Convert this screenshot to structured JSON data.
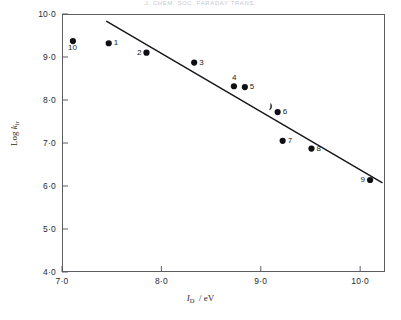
{
  "figure": {
    "running_head": "J. CHEM. SOC. FARADAY TRANS.",
    "background_color": "#ffffff",
    "ink_color": "#1a1a1a"
  },
  "chart_data": {
    "type": "scatter",
    "title": "",
    "subtitle": "",
    "xlabel": "I_D / eV",
    "ylabel": "Log k_ir",
    "xlabel_parts": {
      "symbol": "I",
      "subscript": "D",
      "units": "/ eV"
    },
    "ylabel_parts": {
      "prefix": "Log",
      "symbol": "k",
      "subscript": "ir"
    },
    "xlim": [
      7.0,
      10.25
    ],
    "ylim": [
      4.0,
      10.0
    ],
    "xticks": [
      7.0,
      8.0,
      9.0,
      10.0
    ],
    "yticks": [
      4.0,
      5.0,
      6.0,
      7.0,
      8.0,
      9.0,
      10.0
    ],
    "xtick_labels": [
      "7·0",
      "8·0",
      "9·0",
      "10·0"
    ],
    "ytick_labels": [
      "4·0",
      "5·0",
      "6·0",
      "7·0",
      "8·0",
      "9·0",
      "10·0"
    ],
    "grid": false,
    "legend": false,
    "legend_position": "none",
    "marker": "filled-circle",
    "marker_color": "#101014",
    "marker_size_px": 5,
    "points": [
      {
        "label": "10",
        "x": 7.11,
        "y": 9.37,
        "label_position": "below-left"
      },
      {
        "label": "1",
        "x": 7.47,
        "y": 9.32,
        "label_position": "right"
      },
      {
        "label": "2",
        "x": 7.85,
        "y": 9.1,
        "label_position": "left"
      },
      {
        "label": "3",
        "x": 8.33,
        "y": 8.87,
        "label_position": "right"
      },
      {
        "label": "4",
        "x": 8.73,
        "y": 8.32,
        "label_position": "above"
      },
      {
        "label": "5",
        "x": 8.84,
        "y": 8.3,
        "label_position": "right"
      },
      {
        "label": "6",
        "x": 9.17,
        "y": 7.72,
        "label_position": "right"
      },
      {
        "label": "7",
        "x": 9.22,
        "y": 7.05,
        "label_position": "right"
      },
      {
        "label": "8",
        "x": 9.51,
        "y": 6.87,
        "label_position": "right"
      },
      {
        "label": "9",
        "x": 10.1,
        "y": 6.14,
        "label_position": "left"
      }
    ],
    "fit_line": {
      "name": "least-squares trend line",
      "x_start": 7.45,
      "y_start": 9.83,
      "x_end": 10.22,
      "y_end": 6.08,
      "slope": -1.354,
      "intercept": 19.91,
      "color": "#15151a",
      "style": "solid"
    },
    "annotation_mark": {
      "name": "arrow-tick-mark",
      "x": 9.1,
      "y": 7.92
    }
  }
}
